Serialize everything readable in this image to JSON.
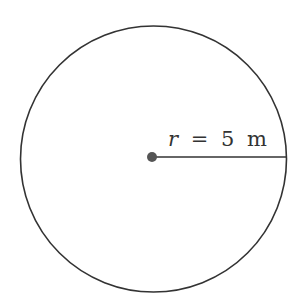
{
  "diagram": {
    "shape": "circle",
    "label": {
      "variable": "r",
      "equals": "=",
      "value": "5",
      "unit": "m",
      "full_text": "r = 5 m"
    },
    "colors": {
      "stroke": "#333333",
      "center_dot": "#555555",
      "background": "#ffffff"
    }
  }
}
